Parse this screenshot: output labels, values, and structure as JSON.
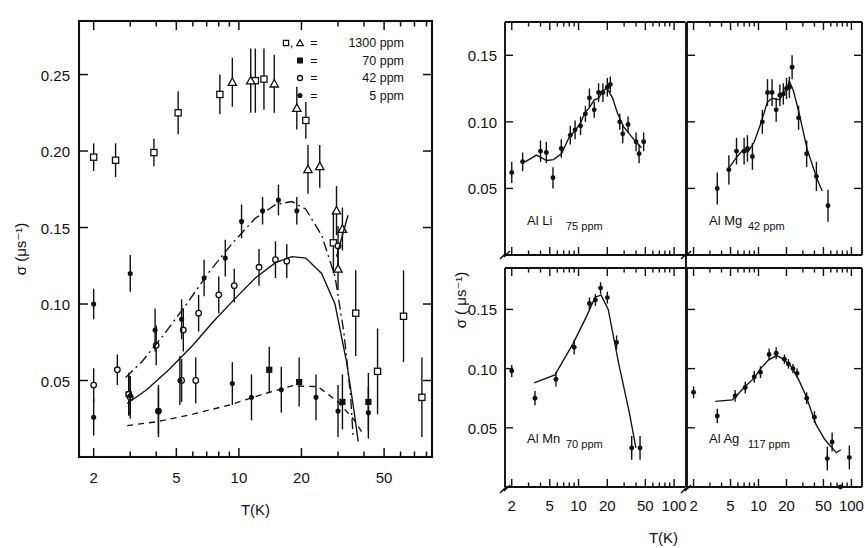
{
  "figure": {
    "background": "#ffffff",
    "ink": "#111111"
  },
  "left_panel": {
    "name": "left-plot",
    "xlabel": "T(K)",
    "ylabel": "σ (μs⁻¹)",
    "x_ticks": [
      "2",
      "5",
      "10",
      "20",
      "50"
    ],
    "y_ticks": [
      "0.05",
      "0.10",
      "0.15",
      "0.20",
      "0.25"
    ],
    "legend": {
      "title": "",
      "entries": [
        {
          "symbols": "open-square, open-triangle",
          "equals": "=",
          "label": "1300 ppm"
        },
        {
          "symbols": "filled-square",
          "equals": "=",
          "label": "70 ppm"
        },
        {
          "symbols": "open-circle",
          "equals": "=",
          "label": "42 ppm"
        },
        {
          "symbols": "filled-circle",
          "equals": "=",
          "label": "5 ppm"
        }
      ]
    }
  },
  "right_panels": {
    "name": "right-plot-grid",
    "xlabel": "T(K)",
    "ylabel": "σ ( μs⁻¹)",
    "x_ticks": [
      "2",
      "5",
      "10",
      "20",
      "50",
      "100"
    ],
    "y_ticks": [
      "0.05",
      "0.10",
      "0.15"
    ],
    "panels": [
      {
        "id": "al-li",
        "alloy": "Al Li",
        "conc": "75 ppm"
      },
      {
        "id": "al-mg",
        "alloy": "Al Mg",
        "conc": "42 ppm"
      },
      {
        "id": "al-mn",
        "alloy": "Al Mn",
        "conc": "70 ppm"
      },
      {
        "id": "al-ag",
        "alloy": "Al Ag",
        "conc": "117 ppm"
      }
    ]
  },
  "chart_data": [
    {
      "id": "left-plot",
      "type": "scatter",
      "title": "",
      "xlabel": "T(K)",
      "ylabel": "σ (μs⁻¹)",
      "xscale": "log",
      "xlim": [
        1.7,
        85
      ],
      "ylim": [
        0.0,
        0.285
      ],
      "grid": false,
      "legend_position": "top-right",
      "series": [
        {
          "name": "1300 ppm",
          "marker": "open-square",
          "points": [
            {
              "x": 2.0,
              "y": 0.196,
              "yerr": 0.009
            },
            {
              "x": 2.55,
              "y": 0.194,
              "yerr": 0.011
            },
            {
              "x": 3.9,
              "y": 0.199,
              "yerr": 0.009
            },
            {
              "x": 5.1,
              "y": 0.225,
              "yerr": 0.014
            },
            {
              "x": 8.1,
              "y": 0.237,
              "yerr": 0.013
            },
            {
              "x": 12.0,
              "y": 0.246,
              "yerr": 0.021
            },
            {
              "x": 13.2,
              "y": 0.247,
              "yerr": 0.02
            },
            {
              "x": 21.0,
              "y": 0.22,
              "yerr": 0.012
            },
            {
              "x": 28.5,
              "y": 0.14,
              "yerr": 0.02
            },
            {
              "x": 36.5,
              "y": 0.094,
              "yerr": 0.028
            },
            {
              "x": 46.5,
              "y": 0.056,
              "yerr": 0.028
            },
            {
              "x": 62.0,
              "y": 0.092,
              "yerr": 0.03
            },
            {
              "x": 76.0,
              "y": 0.039,
              "yerr": 0.026
            }
          ]
        },
        {
          "name": "1300 ppm (triangles)",
          "marker": "open-triangle",
          "points": [
            {
              "x": 9.3,
              "y": 0.245,
              "yerr": 0.016
            },
            {
              "x": 11.4,
              "y": 0.246,
              "yerr": 0.021
            },
            {
              "x": 14.8,
              "y": 0.244,
              "yerr": 0.019
            },
            {
              "x": 19.0,
              "y": 0.228,
              "yerr": 0.014
            },
            {
              "x": 21.5,
              "y": 0.188,
              "yerr": 0.016
            },
            {
              "x": 24.5,
              "y": 0.19,
              "yerr": 0.014
            },
            {
              "x": 29.5,
              "y": 0.161,
              "yerr": 0.016
            },
            {
              "x": 31.5,
              "y": 0.149,
              "yerr": 0.014
            },
            {
              "x": 30.0,
              "y": 0.123,
              "yerr": 0.014
            }
          ]
        },
        {
          "name": "70 ppm",
          "marker": "filled-square",
          "points": [
            {
              "x": 2.95,
              "y": 0.041,
              "yerr": 0.013
            },
            {
              "x": 14.0,
              "y": 0.057,
              "yerr": 0.015
            },
            {
              "x": 19.5,
              "y": 0.049,
              "yerr": 0.016
            },
            {
              "x": 31.5,
              "y": 0.036,
              "yerr": 0.018
            },
            {
              "x": 42.0,
              "y": 0.036,
              "yerr": 0.019
            }
          ]
        },
        {
          "name": "42 ppm",
          "marker": "open-circle",
          "points": [
            {
              "x": 2.0,
              "y": 0.047,
              "yerr": 0.011
            },
            {
              "x": 2.95,
              "y": 0.041,
              "yerr": 0.014
            },
            {
              "x": 3.0,
              "y": 0.039,
              "yerr": 0.014
            },
            {
              "x": 4.1,
              "y": 0.03,
              "yerr": 0.015
            },
            {
              "x": 5.3,
              "y": 0.05,
              "yerr": 0.014
            },
            {
              "x": 6.2,
              "y": 0.05,
              "yerr": 0.015
            },
            {
              "x": 2.6,
              "y": 0.057,
              "yerr": 0.01
            },
            {
              "x": 4.0,
              "y": 0.073,
              "yerr": 0.013
            },
            {
              "x": 5.4,
              "y": 0.083,
              "yerr": 0.014
            },
            {
              "x": 6.4,
              "y": 0.094,
              "yerr": 0.012
            },
            {
              "x": 8.0,
              "y": 0.106,
              "yerr": 0.012
            },
            {
              "x": 9.5,
              "y": 0.112,
              "yerr": 0.011
            },
            {
              "x": 12.5,
              "y": 0.124,
              "yerr": 0.012
            },
            {
              "x": 15.0,
              "y": 0.129,
              "yerr": 0.012
            },
            {
              "x": 17.0,
              "y": 0.128,
              "yerr": 0.011
            },
            {
              "x": 30.0,
              "y": 0.138,
              "yerr": 0.013
            }
          ]
        },
        {
          "name": "5 ppm",
          "marker": "filled-circle",
          "points": [
            {
              "x": 2.0,
              "y": 0.1,
              "yerr": 0.01
            },
            {
              "x": 2.0,
              "y": 0.026,
              "yerr": 0.012
            },
            {
              "x": 3.0,
              "y": 0.04,
              "yerr": 0.013
            },
            {
              "x": 4.1,
              "y": 0.03,
              "yerr": 0.017
            },
            {
              "x": 5.2,
              "y": 0.05,
              "yerr": 0.016
            },
            {
              "x": 9.3,
              "y": 0.048,
              "yerr": 0.014
            },
            {
              "x": 11.5,
              "y": 0.039,
              "yerr": 0.015
            },
            {
              "x": 16.0,
              "y": 0.044,
              "yerr": 0.015
            },
            {
              "x": 23.5,
              "y": 0.039,
              "yerr": 0.015
            },
            {
              "x": 30.0,
              "y": 0.03,
              "yerr": 0.017
            },
            {
              "x": 42.0,
              "y": 0.029,
              "yerr": 0.017
            },
            {
              "x": 3.0,
              "y": 0.12,
              "yerr": 0.012
            },
            {
              "x": 3.95,
              "y": 0.083,
              "yerr": 0.014
            },
            {
              "x": 5.3,
              "y": 0.09,
              "yerr": 0.013
            },
            {
              "x": 6.8,
              "y": 0.117,
              "yerr": 0.012
            },
            {
              "x": 8.6,
              "y": 0.13,
              "yerr": 0.012
            },
            {
              "x": 10.3,
              "y": 0.154,
              "yerr": 0.011
            },
            {
              "x": 13.0,
              "y": 0.161,
              "yerr": 0.009
            },
            {
              "x": 15.5,
              "y": 0.168,
              "yerr": 0.01
            },
            {
              "x": 19.0,
              "y": 0.161,
              "yerr": 0.009
            }
          ]
        }
      ],
      "curves": [
        {
          "name": "70 ppm fit",
          "style": "dash-dot"
        },
        {
          "name": "42 ppm fit",
          "style": "solid"
        },
        {
          "name": "5 ppm fit",
          "style": "dashed"
        }
      ]
    },
    {
      "id": "al-li",
      "type": "scatter",
      "title": "Al Li 75 ppm",
      "xlabel": "T(K)",
      "ylabel": "σ ( μs⁻¹)",
      "xscale": "log",
      "xlim": [
        1.7,
        130
      ],
      "ylim": [
        0.0,
        0.175
      ],
      "values": [
        {
          "x": 2.0,
          "y": 0.062,
          "yerr": 0.008
        },
        {
          "x": 2.6,
          "y": 0.07,
          "yerr": 0.007
        },
        {
          "x": 4.0,
          "y": 0.078,
          "yerr": 0.008
        },
        {
          "x": 4.6,
          "y": 0.077,
          "yerr": 0.008
        },
        {
          "x": 5.4,
          "y": 0.058,
          "yerr": 0.008
        },
        {
          "x": 6.6,
          "y": 0.08,
          "yerr": 0.007
        },
        {
          "x": 8.2,
          "y": 0.09,
          "yerr": 0.007
        },
        {
          "x": 9.2,
          "y": 0.094,
          "yerr": 0.007
        },
        {
          "x": 10.5,
          "y": 0.097,
          "yerr": 0.007
        },
        {
          "x": 11.8,
          "y": 0.106,
          "yerr": 0.006
        },
        {
          "x": 13.0,
          "y": 0.118,
          "yerr": 0.007
        },
        {
          "x": 14.6,
          "y": 0.109,
          "yerr": 0.006
        },
        {
          "x": 16.2,
          "y": 0.122,
          "yerr": 0.007
        },
        {
          "x": 18.0,
          "y": 0.122,
          "yerr": 0.007
        },
        {
          "x": 20.0,
          "y": 0.126,
          "yerr": 0.007
        },
        {
          "x": 21.5,
          "y": 0.128,
          "yerr": 0.006
        },
        {
          "x": 27.0,
          "y": 0.1,
          "yerr": 0.006
        },
        {
          "x": 29.0,
          "y": 0.091,
          "yerr": 0.007
        },
        {
          "x": 33.0,
          "y": 0.098,
          "yerr": 0.006
        },
        {
          "x": 40.0,
          "y": 0.085,
          "yerr": 0.007
        },
        {
          "x": 43.0,
          "y": 0.076,
          "yerr": 0.007
        },
        {
          "x": 48.0,
          "y": 0.085,
          "yerr": 0.007
        }
      ]
    },
    {
      "id": "al-mg",
      "type": "scatter",
      "title": "Al Mg 42 ppm",
      "xlabel": "T(K)",
      "ylabel": "σ ( μs⁻¹)",
      "xscale": "log",
      "xlim": [
        1.7,
        130
      ],
      "ylim": [
        0.0,
        0.175
      ],
      "values": [
        {
          "x": 3.6,
          "y": 0.05,
          "yerr": 0.012
        },
        {
          "x": 4.8,
          "y": 0.064,
          "yerr": 0.011
        },
        {
          "x": 5.8,
          "y": 0.078,
          "yerr": 0.01
        },
        {
          "x": 7.0,
          "y": 0.078,
          "yerr": 0.01
        },
        {
          "x": 7.6,
          "y": 0.08,
          "yerr": 0.01
        },
        {
          "x": 8.6,
          "y": 0.074,
          "yerr": 0.01
        },
        {
          "x": 11.0,
          "y": 0.1,
          "yerr": 0.009
        },
        {
          "x": 12.5,
          "y": 0.122,
          "yerr": 0.01
        },
        {
          "x": 14.0,
          "y": 0.122,
          "yerr": 0.01
        },
        {
          "x": 15.5,
          "y": 0.109,
          "yerr": 0.009
        },
        {
          "x": 17.0,
          "y": 0.12,
          "yerr": 0.008
        },
        {
          "x": 18.5,
          "y": 0.121,
          "yerr": 0.008
        },
        {
          "x": 20.0,
          "y": 0.125,
          "yerr": 0.008
        },
        {
          "x": 21.5,
          "y": 0.126,
          "yerr": 0.008
        },
        {
          "x": 23.0,
          "y": 0.141,
          "yerr": 0.009
        },
        {
          "x": 27.0,
          "y": 0.103,
          "yerr": 0.009
        },
        {
          "x": 33.0,
          "y": 0.076,
          "yerr": 0.01
        },
        {
          "x": 42.0,
          "y": 0.059,
          "yerr": 0.011
        },
        {
          "x": 56.0,
          "y": 0.037,
          "yerr": 0.012
        }
      ]
    },
    {
      "id": "al-mn",
      "type": "scatter",
      "title": "Al Mn 70 ppm",
      "xlabel": "T(K)",
      "ylabel": "σ ( μs⁻¹)",
      "xscale": "log",
      "xlim": [
        1.7,
        130
      ],
      "ylim": [
        0.0,
        0.185
      ],
      "values": [
        {
          "x": 2.0,
          "y": 0.098,
          "yerr": 0.005
        },
        {
          "x": 3.5,
          "y": 0.075,
          "yerr": 0.006
        },
        {
          "x": 5.8,
          "y": 0.091,
          "yerr": 0.006
        },
        {
          "x": 9.0,
          "y": 0.118,
          "yerr": 0.006
        },
        {
          "x": 13.0,
          "y": 0.155,
          "yerr": 0.005
        },
        {
          "x": 15.0,
          "y": 0.158,
          "yerr": 0.005
        },
        {
          "x": 17.0,
          "y": 0.168,
          "yerr": 0.005
        },
        {
          "x": 20.0,
          "y": 0.16,
          "yerr": 0.005
        },
        {
          "x": 25.0,
          "y": 0.122,
          "yerr": 0.006
        },
        {
          "x": 36.0,
          "y": 0.033,
          "yerr": 0.01
        },
        {
          "x": 44.0,
          "y": 0.033,
          "yerr": 0.01
        }
      ]
    },
    {
      "id": "al-ag",
      "type": "scatter",
      "title": "Al Ag 117 ppm",
      "xlabel": "T(K)",
      "ylabel": "σ ( μs⁻¹)",
      "xscale": "log",
      "xlim": [
        1.7,
        130
      ],
      "ylim": [
        0.0,
        0.185
      ],
      "values": [
        {
          "x": 2.0,
          "y": 0.08,
          "yerr": 0.005
        },
        {
          "x": 3.6,
          "y": 0.06,
          "yerr": 0.006
        },
        {
          "x": 5.6,
          "y": 0.077,
          "yerr": 0.005
        },
        {
          "x": 7.2,
          "y": 0.084,
          "yerr": 0.005
        },
        {
          "x": 9.0,
          "y": 0.093,
          "yerr": 0.005
        },
        {
          "x": 10.5,
          "y": 0.097,
          "yerr": 0.005
        },
        {
          "x": 13.0,
          "y": 0.112,
          "yerr": 0.005
        },
        {
          "x": 15.5,
          "y": 0.113,
          "yerr": 0.005
        },
        {
          "x": 19.0,
          "y": 0.108,
          "yerr": 0.004
        },
        {
          "x": 21.0,
          "y": 0.104,
          "yerr": 0.004
        },
        {
          "x": 23.5,
          "y": 0.1,
          "yerr": 0.004
        },
        {
          "x": 26.0,
          "y": 0.096,
          "yerr": 0.004
        },
        {
          "x": 33.0,
          "y": 0.075,
          "yerr": 0.005
        },
        {
          "x": 40.0,
          "y": 0.059,
          "yerr": 0.005
        },
        {
          "x": 55.0,
          "y": 0.024,
          "yerr": 0.01
        },
        {
          "x": 62.0,
          "y": 0.038,
          "yerr": 0.008
        },
        {
          "x": 76.0,
          "y": 0.0,
          "yerr": 0.0
        },
        {
          "x": 95.0,
          "y": 0.025,
          "yerr": 0.01
        }
      ]
    }
  ]
}
